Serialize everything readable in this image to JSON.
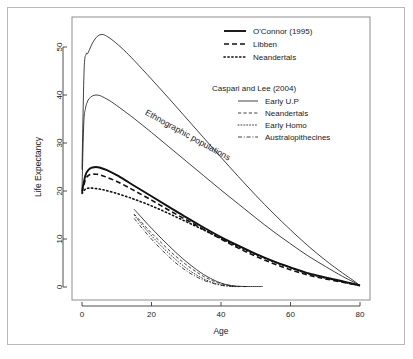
{
  "figure": {
    "background_color": "#ffffff",
    "frame_color": "#b9b9b9",
    "plot_frame_color": "#8d8d8d",
    "curve_color": "#111111"
  },
  "annotations": [
    {
      "name": "ethnographic-populations",
      "text": "Ethnographic populations",
      "x": 18,
      "y": 36,
      "rotation": 29
    }
  ],
  "legend": {
    "group1": {
      "items": [
        {
          "label": "O'Connor (1995)",
          "style": "solid",
          "width": 1.9
        },
        {
          "label": "Libben",
          "style": "dashed",
          "width": 1.6
        },
        {
          "label": "Neandertals",
          "style": "dotted",
          "width": 1.6
        }
      ]
    },
    "group2": {
      "title": "Caspari and Lee (2004)",
      "items": [
        {
          "label": "Early U.P",
          "style": "solid",
          "width": 0.8
        },
        {
          "label": "Neandertals",
          "style": "dashed",
          "width": 0.8
        },
        {
          "label": "Early Homo",
          "style": "dotted",
          "width": 0.8
        },
        {
          "label": "Australopithecines",
          "style": "dashdot",
          "width": 0.8
        }
      ]
    }
  },
  "chart_data": {
    "type": "line",
    "title": "",
    "xlabel": "Age",
    "ylabel": "Life Expectancy",
    "xlim": [
      -2,
      82
    ],
    "ylim": [
      -2.5,
      56
    ],
    "xticks": [
      0,
      20,
      40,
      60,
      80
    ],
    "yticks": [
      0,
      10,
      20,
      30,
      40,
      50
    ],
    "grid": false,
    "legend_position": "top-right",
    "series": [
      {
        "name": "Ethnographic upper",
        "group": "Ethnographic populations",
        "style": "solid",
        "width": 0.8,
        "points": [
          [
            0,
            24.5
          ],
          [
            0.6,
            45.0
          ],
          [
            1.2,
            48.5
          ],
          [
            1.6,
            48.6
          ],
          [
            2,
            49.2
          ],
          [
            3,
            50.8
          ],
          [
            4,
            51.9
          ],
          [
            5,
            52.5
          ],
          [
            6,
            52.6
          ],
          [
            7,
            52.3
          ],
          [
            9,
            51.3
          ],
          [
            12,
            49.4
          ],
          [
            15,
            47.2
          ],
          [
            20,
            43.3
          ],
          [
            25,
            39.3
          ],
          [
            30,
            35.2
          ],
          [
            35,
            31.1
          ],
          [
            40,
            27.0
          ],
          [
            45,
            23.0
          ],
          [
            50,
            19.1
          ],
          [
            55,
            15.4
          ],
          [
            60,
            11.9
          ],
          [
            65,
            8.6
          ],
          [
            70,
            5.6
          ],
          [
            75,
            2.9
          ],
          [
            78,
            1.4
          ],
          [
            80,
            0.3
          ]
        ]
      },
      {
        "name": "Ethnographic lower",
        "group": "Ethnographic populations",
        "style": "solid",
        "width": 0.8,
        "points": [
          [
            0,
            20.4
          ],
          [
            0.5,
            34.0
          ],
          [
            1,
            37.2
          ],
          [
            1.5,
            38.5
          ],
          [
            2,
            39.2
          ],
          [
            3,
            39.8
          ],
          [
            4,
            40.0
          ],
          [
            5,
            39.9
          ],
          [
            6,
            39.6
          ],
          [
            8,
            38.8
          ],
          [
            10,
            37.8
          ],
          [
            13,
            36.2
          ],
          [
            15,
            35.1
          ],
          [
            20,
            32.2
          ],
          [
            25,
            29.2
          ],
          [
            30,
            26.2
          ],
          [
            35,
            23.2
          ],
          [
            40,
            20.2
          ],
          [
            45,
            17.3
          ],
          [
            50,
            14.4
          ],
          [
            55,
            11.6
          ],
          [
            60,
            9.0
          ],
          [
            65,
            6.5
          ],
          [
            70,
            4.3
          ],
          [
            75,
            2.2
          ],
          [
            78,
            1.1
          ],
          [
            80,
            0.3
          ]
        ]
      },
      {
        "name": "O'Connor (1995)",
        "group": "main",
        "style": "solid",
        "width": 1.9,
        "points": [
          [
            0,
            19.9
          ],
          [
            1,
            23.3
          ],
          [
            2,
            24.5
          ],
          [
            3,
            24.9
          ],
          [
            4,
            25.0
          ],
          [
            5,
            24.9
          ],
          [
            7,
            24.4
          ],
          [
            10,
            23.3
          ],
          [
            13,
            22.0
          ],
          [
            15,
            21.1
          ],
          [
            20,
            18.9
          ],
          [
            25,
            16.7
          ],
          [
            30,
            14.5
          ],
          [
            35,
            12.4
          ],
          [
            40,
            10.4
          ],
          [
            45,
            8.6
          ],
          [
            50,
            6.9
          ],
          [
            55,
            5.4
          ],
          [
            60,
            4.1
          ],
          [
            65,
            2.9
          ],
          [
            70,
            2.0
          ],
          [
            75,
            1.2
          ],
          [
            78,
            0.7
          ],
          [
            80,
            0.3
          ]
        ]
      },
      {
        "name": "Libben",
        "group": "main",
        "style": "dashed",
        "width": 1.6,
        "points": [
          [
            0,
            19.6
          ],
          [
            1,
            22.4
          ],
          [
            2,
            23.3
          ],
          [
            3,
            23.5
          ],
          [
            4,
            23.5
          ],
          [
            5,
            23.4
          ],
          [
            7,
            22.9
          ],
          [
            10,
            22.0
          ],
          [
            13,
            20.9
          ],
          [
            15,
            20.1
          ],
          [
            20,
            18.1
          ],
          [
            25,
            16.0
          ],
          [
            30,
            14.0
          ],
          [
            35,
            12.0
          ],
          [
            40,
            10.0
          ],
          [
            45,
            8.1
          ],
          [
            50,
            6.4
          ],
          [
            55,
            4.9
          ],
          [
            60,
            3.6
          ],
          [
            65,
            2.5
          ],
          [
            70,
            1.7
          ],
          [
            75,
            1.0
          ],
          [
            78,
            0.6
          ],
          [
            80,
            0.3
          ]
        ]
      },
      {
        "name": "Neandertals",
        "group": "main",
        "style": "dotted",
        "width": 1.6,
        "points": [
          [
            0,
            19.5
          ],
          [
            1,
            20.4
          ],
          [
            2,
            20.6
          ],
          [
            3,
            20.6
          ],
          [
            5,
            20.4
          ],
          [
            7,
            20.1
          ],
          [
            10,
            19.5
          ],
          [
            13,
            18.8
          ],
          [
            15,
            18.3
          ],
          [
            20,
            16.9
          ],
          [
            25,
            15.3
          ],
          [
            30,
            13.6
          ],
          [
            35,
            11.9
          ],
          [
            40,
            10.1
          ],
          [
            45,
            8.4
          ],
          [
            50,
            6.8
          ],
          [
            55,
            5.3
          ],
          [
            60,
            4.0
          ],
          [
            65,
            2.8
          ],
          [
            70,
            1.9
          ],
          [
            75,
            1.1
          ],
          [
            78,
            0.6
          ],
          [
            80,
            0.3
          ]
        ]
      },
      {
        "name": "Early U.P",
        "group": "Caspari and Lee (2004)",
        "style": "solid",
        "width": 0.8,
        "points": [
          [
            15,
            16.2
          ],
          [
            17,
            14.6
          ],
          [
            19,
            13.0
          ],
          [
            21,
            11.5
          ],
          [
            23,
            10.0
          ],
          [
            25,
            8.6
          ],
          [
            27,
            7.2
          ],
          [
            29,
            5.9
          ],
          [
            31,
            4.7
          ],
          [
            33,
            3.6
          ],
          [
            35,
            2.6
          ],
          [
            37,
            1.8
          ],
          [
            39,
            1.1
          ],
          [
            41,
            0.6
          ],
          [
            43,
            0.3
          ],
          [
            45,
            0.15
          ],
          [
            48,
            0.1
          ],
          [
            52,
            0.1
          ]
        ]
      },
      {
        "name": "Neandertals (Caspari)",
        "group": "Caspari and Lee (2004)",
        "style": "dashed",
        "width": 0.8,
        "points": [
          [
            15,
            15.2
          ],
          [
            17,
            13.6
          ],
          [
            19,
            12.0
          ],
          [
            21,
            10.5
          ],
          [
            23,
            9.1
          ],
          [
            25,
            7.7
          ],
          [
            27,
            6.4
          ],
          [
            29,
            5.2
          ],
          [
            31,
            4.1
          ],
          [
            33,
            3.1
          ],
          [
            35,
            2.2
          ],
          [
            37,
            1.5
          ],
          [
            39,
            0.9
          ],
          [
            41,
            0.5
          ],
          [
            43,
            0.25
          ],
          [
            45,
            0.12
          ],
          [
            48,
            0.08
          ]
        ]
      },
      {
        "name": "Early Homo",
        "group": "Caspari and Lee (2004)",
        "style": "dotted",
        "width": 0.8,
        "points": [
          [
            15,
            15.0
          ],
          [
            17,
            13.2
          ],
          [
            19,
            11.5
          ],
          [
            21,
            9.9
          ],
          [
            23,
            8.4
          ],
          [
            25,
            7.0
          ],
          [
            27,
            5.7
          ],
          [
            29,
            4.5
          ],
          [
            31,
            3.4
          ],
          [
            33,
            2.5
          ],
          [
            35,
            1.7
          ],
          [
            37,
            1.1
          ],
          [
            39,
            0.6
          ],
          [
            41,
            0.3
          ],
          [
            43,
            0.15
          ],
          [
            45,
            0.08
          ]
        ]
      },
      {
        "name": "Australopithecines",
        "group": "Caspari and Lee (2004)",
        "style": "dashdot",
        "width": 0.8,
        "points": [
          [
            15,
            14.3
          ],
          [
            17,
            12.5
          ],
          [
            19,
            10.8
          ],
          [
            21,
            9.2
          ],
          [
            23,
            7.7
          ],
          [
            25,
            6.3
          ],
          [
            27,
            5.0
          ],
          [
            29,
            3.9
          ],
          [
            31,
            2.9
          ],
          [
            33,
            2.1
          ],
          [
            35,
            1.4
          ],
          [
            37,
            0.9
          ],
          [
            39,
            0.5
          ],
          [
            41,
            0.25
          ],
          [
            43,
            0.12
          ],
          [
            45,
            0.06
          ]
        ]
      }
    ]
  }
}
